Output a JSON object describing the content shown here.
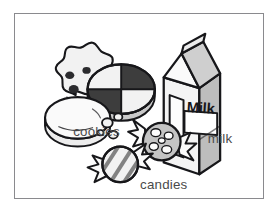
{
  "illustration": {
    "title": "Snack items vocabulary picture",
    "border_color": "#8a8a8e",
    "background_color": "#ffffff",
    "ink_color": "#17171a",
    "label_color": "#4a4a4a",
    "fill_light": "#f2f2f2",
    "fill_mid": "#bdbdbd",
    "fill_dark": "#3d3d3d"
  },
  "labels": {
    "cookies": "cookies",
    "milk": "milk",
    "candies": "candies"
  },
  "items": {
    "milk_carton": {
      "name": "milk-carton",
      "package_text": "Milk"
    },
    "cookies_group": {
      "name": "cookies-group",
      "pieces": [
        "chocolate-chip-cookie",
        "quadrant-cookie",
        "plain-oval-cookie",
        "crumbs"
      ]
    },
    "candies_group": {
      "name": "candies-group",
      "pieces": [
        "spotted-wrapped-candy",
        "striped-wrapped-candy"
      ]
    }
  }
}
